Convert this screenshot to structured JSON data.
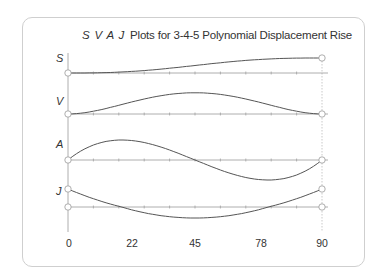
{
  "chart_data": {
    "type": "line",
    "title_prefix": "S V A J",
    "title_text": "Plots for 3-4-5 Polynomial Displacement Rise",
    "xlabel": "",
    "x_ticks": [
      "0",
      "22",
      "45",
      "78",
      "90"
    ],
    "xlim": [
      0,
      90
    ],
    "grid": false,
    "legend": "none",
    "series": [
      {
        "name": "S",
        "label": "S",
        "description": "Displacement: smooth S-curve rising from 0 to max",
        "x": [
          0,
          9,
          18,
          27,
          36,
          45,
          54,
          63,
          72,
          81,
          90
        ],
        "values": [
          0,
          0.0086,
          0.058,
          0.163,
          0.317,
          0.5,
          0.683,
          0.837,
          0.942,
          0.991,
          1.0
        ]
      },
      {
        "name": "V",
        "label": "V",
        "description": "Velocity: bell shape, zero at ends, peak at 45",
        "x": [
          0,
          9,
          18,
          27,
          36,
          45,
          54,
          63,
          72,
          81,
          90
        ],
        "values": [
          0,
          0.162,
          0.512,
          0.882,
          1.152,
          1.25,
          1.152,
          0.882,
          0.512,
          0.162,
          0
        ]
      },
      {
        "name": "A",
        "label": "A",
        "description": "Acceleration: positive lobe then negative lobe, zero at ends and middle",
        "x": [
          0,
          9,
          18,
          27,
          36,
          45,
          54,
          63,
          72,
          81,
          90
        ],
        "values": [
          0,
          0.8,
          1.0,
          0.8,
          0.4,
          0,
          -0.4,
          -0.8,
          -1.0,
          -0.8,
          0
        ]
      },
      {
        "name": "J",
        "label": "J",
        "description": "Jerk: parabola, positive at ends, negative minimum at midpoint",
        "x": [
          0,
          9,
          18,
          27,
          36,
          45,
          54,
          63,
          72,
          81,
          90
        ],
        "values": [
          1.0,
          0.44,
          0.0,
          -0.32,
          -0.44,
          -0.5,
          -0.44,
          -0.32,
          0.0,
          0.44,
          1.0
        ]
      }
    ]
  },
  "labels": {
    "s": "S",
    "v": "V",
    "a": "A",
    "j": "J"
  }
}
